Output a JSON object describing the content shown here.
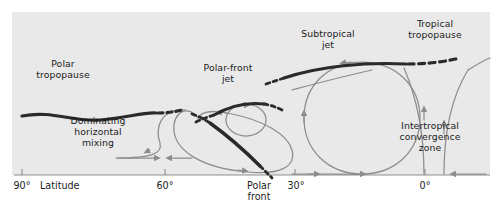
{
  "figure": {
    "background": "#e9e9e9",
    "page_background": "#ffffff",
    "type": "atmospheric-general-circulation-cross-section"
  },
  "colors": {
    "panel": "#e9e9e9",
    "dark_line": "#2a2a2a",
    "flow_line": "#8d8d8d",
    "axis": "#8d8d8d",
    "text": "#1b1b1b"
  },
  "labels": {
    "polar_tropopause": "Polar\ntropopause",
    "dominating_mixing": "Dominating\nhorizontal\nmixing",
    "polar_front_jet": "Polar-front\njet",
    "subtropical_jet": "Subtropical\njet",
    "tropical_tropopause": "Tropical\ntropopause",
    "itcz": "Intertropical\nconvergence\nzone",
    "polar_front": "Polar\nfront"
  },
  "axis": {
    "title": "Latitude",
    "ticks": [
      {
        "label": "90°",
        "x": 22
      },
      {
        "label": "60°",
        "x": 165
      },
      {
        "label": "30°",
        "x": 295
      },
      {
        "label": "0°",
        "x": 425
      }
    ],
    "tick_labels": [
      "90°",
      "60°",
      "30°",
      "0°"
    ],
    "latitude_label": "Latitude"
  },
  "features": [
    {
      "name": "polar-tropopause",
      "style": "thick-dark-wavy",
      "dashed_end": true
    },
    {
      "name": "polar-front-jet",
      "style": "thick-dark-arc",
      "dashed_both_ends": true
    },
    {
      "name": "subtropical-jet",
      "style": "thick-dark-arc",
      "dashed_both_ends": true
    },
    {
      "name": "tropical-tropopause",
      "style": "thick-dark-dashed"
    },
    {
      "name": "polar-front",
      "style": "thick-dark-diagonal",
      "dashed_both_ends": true
    },
    {
      "name": "hadley-cell",
      "style": "gray-circulation-loop"
    },
    {
      "name": "ferrel-cell",
      "style": "gray-circulation-loop"
    },
    {
      "name": "polar-eddy",
      "style": "gray-small-loop"
    },
    {
      "name": "itcz-updraft",
      "style": "gray-converging-curves"
    }
  ]
}
